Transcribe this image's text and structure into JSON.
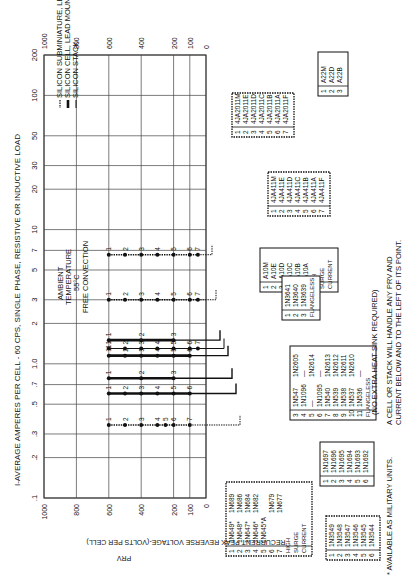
{
  "chart_data": {
    "type": "line",
    "orientation": "rotated-90-counterclockwise",
    "title": "I-AVERAGE AMPERES PER CELL - 60 CPS, SINGLE PHASE, RESISTIVE OR INDUCTIVE LOAD",
    "xlabel": "I-AVERAGE AMPERES PER CELL - 60 CPS, SINGLE PHASE, RESISTIVE OR INDUCTIVE LOAD",
    "ylabel": "RECURRENT PEAK REVERSE VOLTAGE-(VOLTS PER CELL)",
    "ylabel2": "PRV",
    "x_scale": "log",
    "xlim": [
      0.1,
      200
    ],
    "x_ticks": [
      ".1",
      ".2",
      ".3",
      ".5",
      ".7",
      "1.0",
      "2",
      "3",
      "5",
      "7",
      "10",
      "20",
      "30",
      "50",
      "100",
      "200"
    ],
    "x_tick_values": [
      0.1,
      0.2,
      0.3,
      0.5,
      0.7,
      1.0,
      2,
      3,
      5,
      7,
      10,
      20,
      30,
      50,
      100,
      200
    ],
    "ylim": [
      0,
      1000
    ],
    "y_ticks": [
      "1000",
      "800",
      "600",
      "400",
      "200",
      "100",
      "0"
    ],
    "y_tick_values": [
      1000,
      800,
      600,
      400,
      200,
      100,
      0
    ],
    "grid": true,
    "legend": {
      "placement": "top-left",
      "entries": [
        {
          "style": "dotted-bead",
          "label": "SILICON SUBMINIATURE, LEAD MOUNTED"
        },
        {
          "style": "thick",
          "label": "SILICON CELL, LEAD MOUNTED"
        },
        {
          "style": "thin",
          "label": "SILICON STACK"
        }
      ]
    },
    "annotation_ambient": [
      "AMBIENT",
      "TEMPERATURE",
      "55°C",
      "FREE CONVECTION"
    ],
    "series": [
      {
        "name": "4JA2011 series",
        "style": "dotted-bead",
        "current": 6.5,
        "prv": [
          600,
          500,
          400,
          300,
          200,
          100,
          50
        ],
        "labels": [
          "1",
          "2",
          "3",
          "4",
          "5",
          "6",
          "7"
        ],
        "box": "box_4ja2011"
      },
      {
        "name": "4JA411 series",
        "style": "dotted-bead",
        "current": 3.0,
        "prv": [
          600,
          500,
          400,
          300,
          200,
          100,
          50
        ],
        "labels": [
          "1",
          "2",
          "3",
          "4",
          "5",
          "6",
          "7"
        ],
        "box": "box_4ja411"
      },
      {
        "name": "A10 series",
        "style": "thick",
        "current": 1.5,
        "prv": [
          600,
          400,
          200
        ],
        "labels": [
          "1",
          "2",
          "3"
        ],
        "box": "box_a10"
      },
      {
        "name": "1N3641 flangeless",
        "style": "thin",
        "current": 1.3,
        "prv": [
          600,
          500,
          400,
          300,
          200,
          100,
          50
        ],
        "labels": [
          "1",
          "2",
          "3",
          "4",
          "5",
          "6",
          "7"
        ],
        "box": "box_1n3641"
      },
      {
        "name": "1N547/1N2605 series",
        "style": "thick",
        "current": 1.15,
        "prv": [
          600,
          500,
          400,
          300,
          200,
          100
        ],
        "labels": [
          "11",
          "2",
          "3",
          "4",
          "5",
          "6"
        ],
        "box": "box_1n547"
      },
      {
        "name": "1N1697 series",
        "style": "thick",
        "current": 0.78,
        "prv": [
          600,
          400,
          200
        ],
        "labels": [
          "1",
          "2",
          "3"
        ],
        "box": "box_1n1697"
      },
      {
        "name": "1N649 series",
        "style": "thick",
        "current": 0.6,
        "prv": [
          600,
          500,
          400,
          300,
          200,
          100
        ],
        "labels": [
          "1",
          "2",
          "3",
          "4",
          "5",
          "6"
        ],
        "box": "box_1n649"
      },
      {
        "name": "1N3549 series",
        "style": "dotted-bead",
        "current": 0.35,
        "prv": [
          600,
          500,
          400,
          300,
          250,
          200,
          100
        ],
        "labels": [
          "1",
          "2",
          "3",
          "4",
          "5",
          "6",
          "7"
        ],
        "box": "box_1n3549"
      }
    ]
  },
  "boxes": {
    "box_4ja2011": {
      "rows": [
        [
          "1",
          "4JA2011M"
        ],
        [
          "2",
          "4JA2011E"
        ],
        [
          "3",
          "4JA2011D"
        ],
        [
          "4",
          "4JA2011C"
        ],
        [
          "5",
          "4JA2011B"
        ],
        [
          "6",
          "4JA2011A"
        ],
        [
          "7",
          "4JA2011F"
        ]
      ]
    },
    "box_a22": {
      "rows": [
        [
          "1",
          "A22M"
        ],
        [
          "2",
          "A22D"
        ],
        [
          "3",
          "A22B"
        ]
      ]
    },
    "box_4ja411": {
      "rows": [
        [
          "1",
          "4JA411M"
        ],
        [
          "2",
          "4JA411E"
        ],
        [
          "3",
          "4JA411D"
        ],
        [
          "4",
          "4JA411C"
        ],
        [
          "5",
          "4JA411B"
        ],
        [
          "6",
          "4JA411A"
        ],
        [
          "7",
          "4JA411F"
        ]
      ]
    },
    "box_a10": {
      "rows": [
        [
          "1",
          "A10M"
        ],
        [
          "2",
          "A10E"
        ],
        [
          "3",
          "A10D"
        ],
        [
          "4",
          "A10C"
        ],
        [
          "5",
          "A10B"
        ],
        [
          "6",
          "A10A"
        ]
      ],
      "footer": [
        "HIGH",
        "SURGE",
        "CURRENT"
      ]
    },
    "box_1n3641": {
      "rows": [
        [
          "1",
          "1N3641"
        ],
        [
          "2",
          "1N3640"
        ],
        [
          "3",
          "1N3639"
        ]
      ],
      "footer": [
        "FLANGELESS"
      ]
    },
    "box_1n547": {
      "rows": [
        [
          "3",
          "1N547",
          "1N2605"
        ],
        [
          "4",
          "1N1096",
          "—"
        ],
        [
          "5",
          "—",
          "1N2614"
        ],
        [
          "6",
          "1N1095",
          "—"
        ],
        [
          "7",
          "1N540",
          "1N2613"
        ],
        [
          "8",
          "1N539",
          "1N2612"
        ],
        [
          "9",
          "1N538",
          "1N2611"
        ],
        [
          "10",
          "1N537",
          "1N2610"
        ],
        [
          "11",
          "1N536",
          "—"
        ]
      ],
      "footer": [
        "FLANGELESS"
      ]
    },
    "box_1n1697": {
      "rows": [
        [
          "1",
          "1N1697"
        ],
        [
          "2",
          "1N1696"
        ],
        [
          "3",
          "1N1695"
        ],
        [
          "4",
          "1N1694"
        ],
        [
          "5",
          "1N1693"
        ],
        [
          "6",
          "1N1692"
        ]
      ]
    },
    "box_1n649": {
      "rows": [
        [
          "1",
          "1N649*",
          "1N689"
        ],
        [
          "2",
          "1N648*",
          "1N686"
        ],
        [
          "3",
          "1N647*",
          "1N684"
        ],
        [
          "4",
          "1N646*",
          "1N682"
        ],
        [
          "5",
          "1N645*A",
          ""
        ],
        [
          "6",
          "",
          "1N679"
        ],
        [
          "7",
          "",
          "1N677"
        ]
      ],
      "footer": [
        "HIGH",
        "SURGE",
        "CURRENT"
      ]
    },
    "box_1n3549": {
      "rows": [
        [
          "1",
          "1N3549"
        ],
        [
          "2",
          "1N3548"
        ],
        [
          "3",
          "1N3547"
        ],
        [
          "4",
          "1N3546"
        ],
        [
          "5",
          "1N3545"
        ],
        [
          "6",
          "1N3544"
        ]
      ]
    }
  },
  "notes": {
    "heat_sink": "(NO EXTRA HEAT SINK REQUIRED)",
    "cell_stack_1": "A CELL OR STACK WILL HANDLE ANY PRV AND",
    "cell_stack_2": "CURRENT BELOW AND TO THE LEFT OF ITS POINT.",
    "military": "* AVAILABLE AS MILITARY UNITS."
  }
}
